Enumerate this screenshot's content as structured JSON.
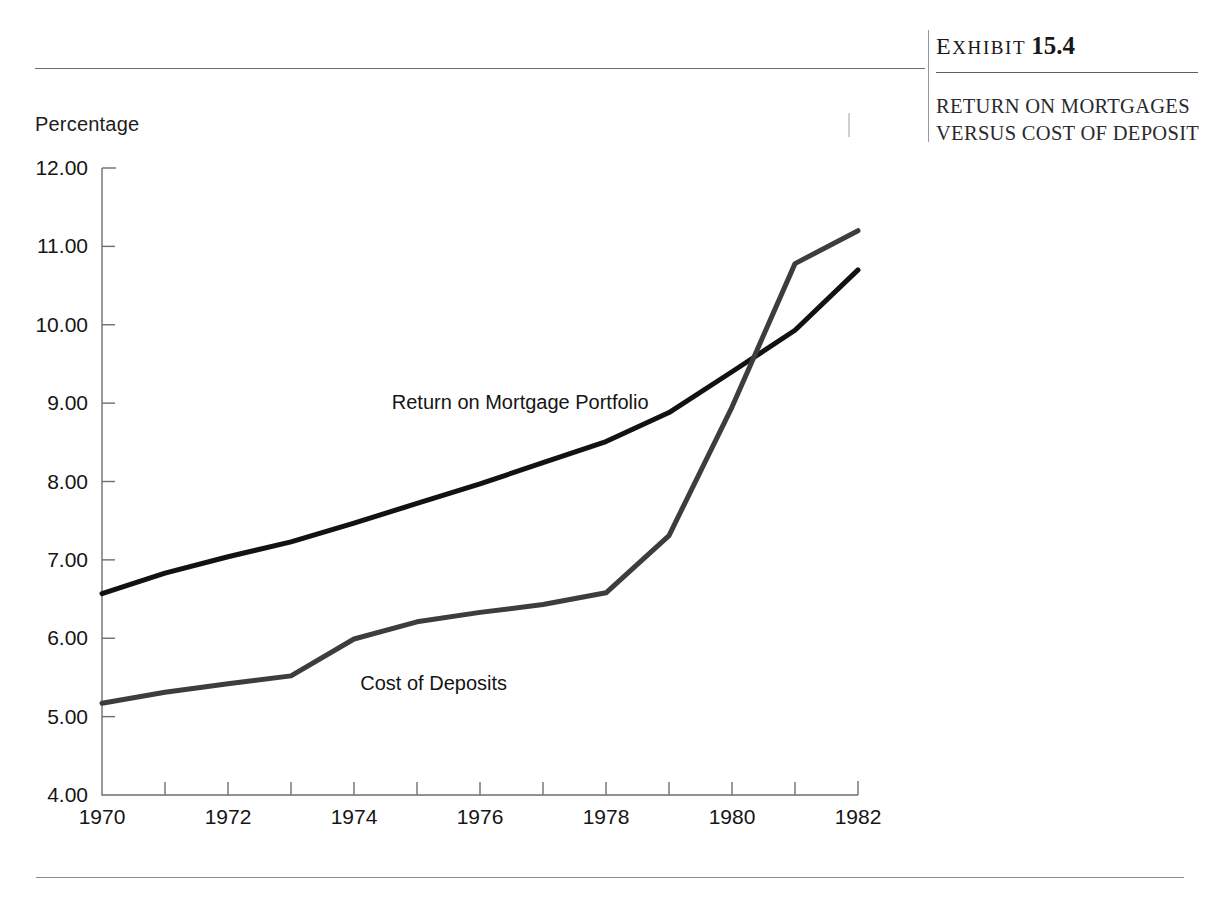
{
  "exhibit": {
    "label_word": "EXHIBIT",
    "number": "15.4",
    "title": "RETURN ON MORTGAGES VERSUS COST OF DEPOSIT"
  },
  "chart_data": {
    "type": "line",
    "title": "RETURN ON MORTGAGES VERSUS COST OF DEPOSIT",
    "xlabel": "",
    "ylabel": "Percentage",
    "xlim": [
      1970,
      1982
    ],
    "ylim": [
      4.0,
      12.0
    ],
    "grid": false,
    "legend_position": "inline-annotations",
    "x": [
      1970,
      1971,
      1972,
      1973,
      1974,
      1975,
      1976,
      1977,
      1978,
      1979,
      1980,
      1981,
      1982
    ],
    "xticks": [
      1970,
      1972,
      1974,
      1976,
      1978,
      1980,
      1982
    ],
    "xtick_labels": [
      "1970",
      "1972",
      "1974",
      "1976",
      "1978",
      "1980",
      "1982"
    ],
    "xticks_minor": [
      1971,
      1973,
      1975,
      1977,
      1979,
      1981
    ],
    "yticks": [
      4.0,
      5.0,
      6.0,
      7.0,
      8.0,
      9.0,
      10.0,
      11.0,
      12.0
    ],
    "ytick_labels": [
      "4.00",
      "5.00",
      "6.00",
      "7.00",
      "8.00",
      "9.00",
      "10.00",
      "11.00",
      "12.00"
    ],
    "series": [
      {
        "name": "Return on Mortgage Portfolio",
        "color": "#121212",
        "linewidth": 5.0,
        "label_x": 1974.6,
        "label_y": 8.92,
        "values": [
          6.57,
          6.83,
          7.04,
          7.23,
          7.47,
          7.72,
          7.97,
          8.24,
          8.51,
          8.88,
          9.4,
          9.93,
          10.7
        ]
      },
      {
        "name": "Cost of Deposits",
        "color": "#3d3d3d",
        "linewidth": 5.0,
        "label_x": 1974.1,
        "label_y": 5.34,
        "values": [
          5.17,
          5.31,
          5.42,
          5.52,
          5.99,
          6.21,
          6.33,
          6.43,
          6.58,
          7.31,
          8.95,
          10.78,
          11.2
        ]
      }
    ],
    "annotations": [
      {
        "text": "Percentage",
        "role": "y-axis-title"
      }
    ]
  }
}
